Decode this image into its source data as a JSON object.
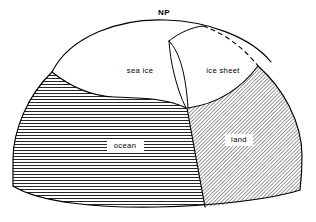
{
  "figure": {
    "name": "polar-cap-schematic",
    "background_color": "#ffffff",
    "line_color": "#000000"
  },
  "labels": {
    "north_pole": "NP",
    "sea_ice": "sea ice",
    "ice_sheet": "ice sheet",
    "ocean": "ocean",
    "land": "land"
  },
  "regions": [
    {
      "id": "sea-ice",
      "label": "sea ice",
      "fill": "white",
      "pattern": "none",
      "label_x": 140,
      "label_y": 71
    },
    {
      "id": "ice-sheet",
      "label": "ice sheet",
      "fill": "white",
      "pattern": "none",
      "label_x": 223,
      "label_y": 71
    },
    {
      "id": "ocean",
      "label": "ocean",
      "fill": "white",
      "pattern": "horizontal-lines",
      "label_x": 125,
      "label_y": 146
    },
    {
      "id": "land",
      "label": "land",
      "fill": "white",
      "pattern": "diagonal-hatch",
      "label_x": 239,
      "label_y": 140
    }
  ],
  "annotations": {
    "pole_marker": {
      "text": "NP",
      "x": 164,
      "y": 13
    },
    "hidden_edge": {
      "style": "dashed",
      "meaning": "ice sheet rear boundary hidden behind dome"
    }
  },
  "geometry": {
    "dome_top_arc": "M 52 72 C 70 36 120 18 166 20 C 205 21 250 36 271 62",
    "dome_left_edge": "M 52 72 C 28 95 13 130 13 160 C 13 172 13 180 13 186",
    "dome_right_edge": "M 258 66 C 283 88 302 122 302 156 C 302 172 301 182 300 190",
    "dome_bottom_arc": "M 13 186 C 40 203 100 208 157 207 C 215 206 272 199 300 190",
    "sea_ice_bottom": "M 52 72 C 72 88 92 96 114 97 C 140 98 166 98 186 108",
    "ice_sheet_wall_left": "M 169 41 C 170 60 176 88 186 108",
    "ice_sheet_wall_right": "M 169 41 C 180 52 186 76 188 108",
    "ice_sheet_ridge": "M 169 41 C 180 32 193 27 203 26",
    "ice_sheet_dashed": "M 203 26 C 224 33 244 48 258 66",
    "land_ocean_divider": "M 187 108 C 192 135 199 175 205 207",
    "land_top_boundary": "M 188 108 C 215 104 240 90 258 66"
  },
  "patterns": {
    "ocean_hatch": {
      "type": "horizontal",
      "spacing_px": 3,
      "stroke_width": 0.85
    },
    "land_hatch": {
      "type": "diagonal-45",
      "spacing_px": 2.6,
      "stroke_width": 0.8
    }
  }
}
